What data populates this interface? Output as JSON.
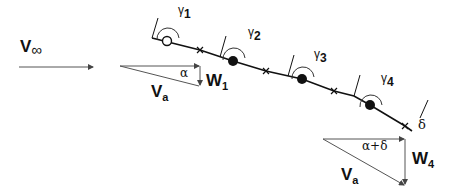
{
  "labels": {
    "v_inf": {
      "main": "V",
      "sub": "∞"
    },
    "gamma1": {
      "main": "γ",
      "sub": "1"
    },
    "gamma2": {
      "main": "γ",
      "sub": "2"
    },
    "gamma3": {
      "main": "γ",
      "sub": "3"
    },
    "gamma4": {
      "main": "γ",
      "sub": "4"
    },
    "delta": "δ",
    "alpha": "α",
    "alpha_delta": "α+δ",
    "w1": {
      "main": "W",
      "sub": "1"
    },
    "w4": {
      "main": "W",
      "sub": "4"
    },
    "va1": {
      "main": "V",
      "sub": "a"
    },
    "va2": {
      "main": "V",
      "sub": "a"
    }
  },
  "colors": {
    "line": "#111111",
    "arrow": "#555555"
  }
}
